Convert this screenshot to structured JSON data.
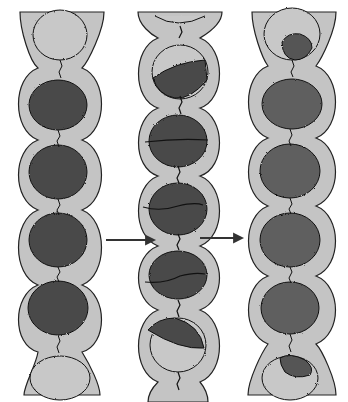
{
  "diagram": {
    "colors": {
      "background": "#ffffff",
      "sheath": "#c4c4c4",
      "outline": "#222222",
      "dark_cell": "#4a4a4a",
      "light_cell": "#c8c8c8",
      "textured_cell": "#5e5e5e"
    },
    "columns": [
      {
        "id": "left",
        "label": "",
        "cells": [
          "light",
          "dark",
          "dark",
          "dark",
          "dark",
          "light"
        ]
      },
      {
        "id": "middle",
        "label": "",
        "cells": [
          "light-partial",
          "half-dark",
          "split",
          "split",
          "split",
          "half-dark",
          "light-partial"
        ]
      },
      {
        "id": "right",
        "label": "",
        "cells": [
          "small-dark",
          "textured",
          "textured",
          "textured",
          "textured",
          "small-dark"
        ]
      }
    ],
    "arrows": [
      {
        "from": "left",
        "to": "middle"
      },
      {
        "from": "middle",
        "to": "right"
      }
    ]
  }
}
